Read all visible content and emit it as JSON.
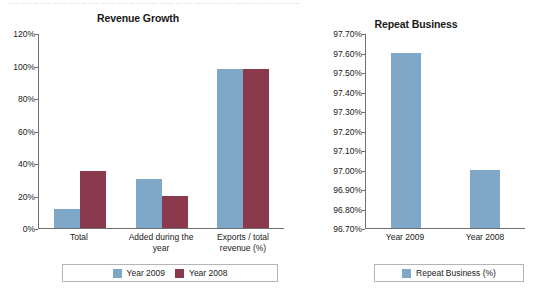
{
  "faded_header": "— — —— — —— ——— —— — —— ——— —— — ———— ——— — —— ———— ——— ————— ——— ————",
  "charts": {
    "revenue": {
      "title": "Revenue Growth",
      "y_ticks": [
        "120%",
        "100%",
        "80%",
        "60%",
        "40%",
        "20%",
        "0%"
      ],
      "categories": [
        "Total",
        "Added during the year",
        "Exports / total revenue (%)"
      ],
      "legend": [
        {
          "label": "Year 2009",
          "color": "#7fa8c8"
        },
        {
          "label": "Year 2008",
          "color": "#8b3a4e"
        }
      ]
    },
    "repeat": {
      "title": "Repeat Business",
      "y_ticks": [
        "97.70%",
        "97.60%",
        "97.50%",
        "97.40%",
        "97.30%",
        "97.20%",
        "97.10%",
        "97.00%",
        "96.90%",
        "96.80%",
        "96.70%"
      ],
      "categories": [
        "Year 2009",
        "Year 2008"
      ],
      "legend": [
        {
          "label": "Repeat Business (%)",
          "color": "#7fa8c8"
        }
      ]
    }
  },
  "chart_data": [
    {
      "type": "bar",
      "title": "Revenue Growth",
      "xlabel": "",
      "ylabel": "",
      "ylim": [
        0,
        120
      ],
      "ytick_values": [
        0,
        20,
        40,
        60,
        80,
        100,
        120
      ],
      "ytick_labels": [
        "0%",
        "20%",
        "40%",
        "60%",
        "80%",
        "100%",
        "120%"
      ],
      "grid": false,
      "legend_position": "bottom",
      "categories": [
        "Total",
        "Added during the year",
        "Exports / total revenue (%)"
      ],
      "series": [
        {
          "name": "Year 2009",
          "color": "#7fa8c8",
          "values": [
            12,
            30,
            98
          ]
        },
        {
          "name": "Year 2008",
          "color": "#8b3a4e",
          "values": [
            35,
            20,
            98
          ]
        }
      ],
      "units": "percent"
    },
    {
      "type": "bar",
      "title": "Repeat Business",
      "xlabel": "",
      "ylabel": "",
      "ylim": [
        96.7,
        97.7
      ],
      "ytick_values": [
        96.7,
        96.8,
        96.9,
        97.0,
        97.1,
        97.2,
        97.3,
        97.4,
        97.5,
        97.6,
        97.7
      ],
      "ytick_labels": [
        "96.70%",
        "96.80%",
        "96.90%",
        "97.00%",
        "97.10%",
        "97.20%",
        "97.30%",
        "97.40%",
        "97.50%",
        "97.60%",
        "97.70%"
      ],
      "grid": false,
      "legend_position": "bottom",
      "categories": [
        "Year 2009",
        "Year 2008"
      ],
      "series": [
        {
          "name": "Repeat Business (%)",
          "color": "#7fa8c8",
          "values": [
            97.6,
            97.0
          ]
        }
      ],
      "units": "percent"
    }
  ]
}
